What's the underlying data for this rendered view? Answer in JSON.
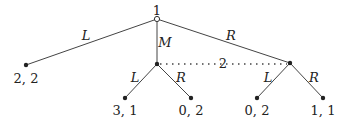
{
  "tree": {
    "root": {
      "player": "1",
      "x": 157,
      "y": 19
    },
    "nodes": [
      {
        "id": "n_mid",
        "x": 157,
        "y": 64
      },
      {
        "id": "n_right",
        "x": 290,
        "y": 63
      }
    ],
    "info_set_label": "2",
    "edges": [
      {
        "label": "L",
        "lx": 84,
        "ly": 38
      },
      {
        "label": "M",
        "lx": 161,
        "ly": 46
      },
      {
        "label": "R",
        "lx": 227,
        "ly": 39
      },
      {
        "label": "L",
        "lx": 133,
        "ly": 80
      },
      {
        "label": "R",
        "lx": 178,
        "ly": 80
      },
      {
        "label": "L",
        "lx": 266,
        "ly": 80
      },
      {
        "label": "R",
        "lx": 311,
        "ly": 80
      }
    ],
    "payoffs": [
      {
        "label": "2, 2",
        "x": 26,
        "y": 82
      },
      {
        "label": "3, 1",
        "x": 125,
        "y": 114
      },
      {
        "label": "0, 2",
        "x": 191,
        "y": 114
      },
      {
        "label": "0, 2",
        "x": 257,
        "y": 114
      },
      {
        "label": "1, 1",
        "x": 323,
        "y": 114
      }
    ]
  }
}
